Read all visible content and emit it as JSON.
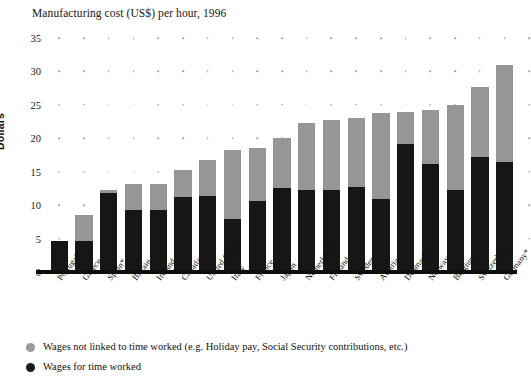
{
  "chart_data": {
    "type": "bar",
    "subtype": "stacked-vertical",
    "title": "Manufacturing cost (US$) per hour, 1996",
    "xlabel": "",
    "ylabel": "Dollars",
    "ylim": [
      0,
      35
    ],
    "yticks": [
      0,
      5,
      10,
      15,
      20,
      25,
      30,
      35
    ],
    "grid": "dotted-horizontal",
    "legend_position": "bottom-left",
    "categories": [
      "Portugal*",
      "Greece",
      "Spain*",
      "Britain",
      "Ireland",
      "Canada",
      "United States",
      "Italy",
      "France",
      "Japan",
      "Netherlands",
      "Finland",
      "Sweden",
      "Austria",
      "Denmark",
      "Norway",
      "Belgium",
      "Switzerland",
      "Germany*"
    ],
    "series": [
      {
        "name": "Wages for time worked",
        "color": "#161616",
        "values": [
          4.6,
          4.6,
          11.8,
          9.3,
          9.3,
          11.2,
          11.3,
          7.9,
          10.6,
          12.6,
          12.2,
          12.3,
          12.7,
          10.9,
          19.1,
          16.2,
          12.3,
          17.2,
          16.5
        ]
      },
      {
        "name": "Wages not linked to time worked (e.g. Holiday pay, Social Security contributions, etc.)",
        "color": "#969696",
        "values": [
          0.0,
          3.9,
          0.4,
          3.8,
          3.8,
          4.0,
          5.4,
          10.4,
          7.9,
          7.4,
          10.1,
          10.4,
          10.3,
          12.9,
          4.9,
          8.0,
          12.7,
          10.4,
          14.4
        ]
      }
    ],
    "totals": [
      4.6,
      8.5,
      12.2,
      13.1,
      13.1,
      15.2,
      16.7,
      18.3,
      18.5,
      20.0,
      22.3,
      22.7,
      23.0,
      23.8,
      24.0,
      24.2,
      25.0,
      27.6,
      30.9
    ]
  },
  "legend": {
    "items": [
      {
        "label": "Wages not linked to time worked (e.g. Holiday pay, Social Security contributions, etc.)",
        "color": "#9a9a9a"
      },
      {
        "label": "Wages for time worked",
        "color": "#1b1b1b"
      }
    ]
  }
}
